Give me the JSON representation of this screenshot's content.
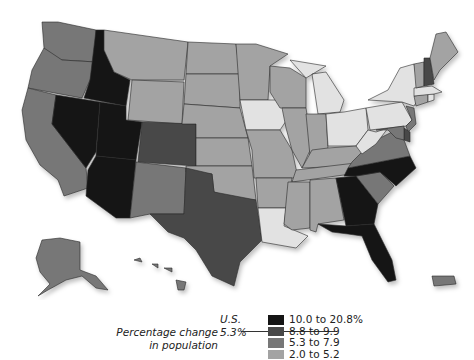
{
  "map": {
    "title": "Percentage change in population",
    "categories": [
      {
        "id": "c1",
        "label": "10.0 to 20.8%",
        "color": "#151515"
      },
      {
        "id": "c2",
        "label": "8.8 to 9.9",
        "color": "#484848"
      },
      {
        "id": "c3",
        "label": "5.3 to 7.9",
        "color": "#777777"
      },
      {
        "id": "c4",
        "label": "2.0 to 5.2",
        "color": "#a3a3a3"
      },
      {
        "id": "c5",
        "label": "",
        "color": "#e2e2e2"
      }
    ],
    "us_average": {
      "label": "U.S.",
      "value": "5.3%"
    },
    "states": {
      "WA": "c3",
      "OR": "c3",
      "CA": "c3",
      "ID": "c1",
      "NV": "c1",
      "UT": "c1",
      "AZ": "c1",
      "MT": "c4",
      "WY": "c4",
      "CO": "c2",
      "NM": "c3",
      "TX": "c2",
      "ND": "c4",
      "SD": "c4",
      "NE": "c4",
      "KS": "c4",
      "OK": "c4",
      "MN": "c4",
      "IA": "c5",
      "MO": "c4",
      "AR": "c4",
      "LA": "c5",
      "WI": "c4",
      "IL": "c4",
      "MI": "c5",
      "IN": "c4",
      "OH": "c5",
      "KY": "c4",
      "TN": "c4",
      "MS": "c4",
      "AL": "c4",
      "GA": "c1",
      "FL": "c1",
      "SC": "c3",
      "NC": "c1",
      "VA": "c3",
      "WV": "c5",
      "PA": "c5",
      "NY": "c5",
      "VT": "c4",
      "NH": "c2",
      "ME": "c4",
      "MA": "c5",
      "CT": "c4",
      "RI": "c5",
      "NJ": "c3",
      "DE": "c2",
      "MD": "c3",
      "AK": "c3",
      "HI": "c3",
      "PR": "c3"
    }
  },
  "legend": {
    "title_line1": "Percentage change",
    "title_line2": "in population",
    "us_label": "U.S.",
    "us_value": "5.3%",
    "items": [
      {
        "label": "10.0 to 20.8%",
        "color": "#151515"
      },
      {
        "label": "8.8 to 9.9",
        "color": "#484848"
      },
      {
        "label": "5.3 to 7.9",
        "color": "#777777"
      },
      {
        "label": "2.0 to 5.2",
        "color": "#a3a3a3"
      }
    ]
  }
}
